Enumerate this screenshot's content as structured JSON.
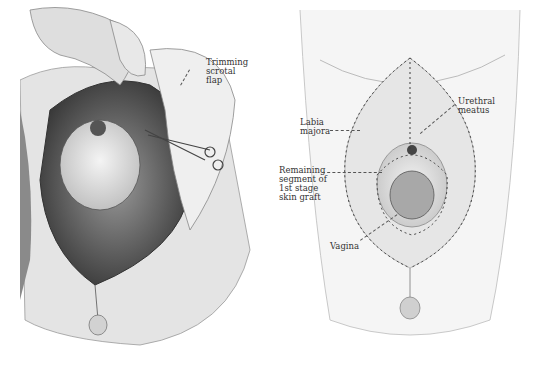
{
  "figure": {
    "left_panel": {
      "labels": [
        {
          "id": "trimming-scrotal-flap",
          "text": "Trimming\nscrotal\nflap"
        }
      ]
    },
    "right_panel": {
      "labels": [
        {
          "id": "labia-majora",
          "text": "Labia\nmajora"
        },
        {
          "id": "urethral-meatus",
          "text": "Urethral\nmeatus"
        },
        {
          "id": "remaining-segment",
          "text": "Remaining\nsegment of\n1st stage\nskin graft"
        },
        {
          "id": "vagina",
          "text": "Vagina"
        }
      ]
    },
    "colors": {
      "background": "#ffffff",
      "skin_light": "#ececec",
      "skin_mid": "#c8c8c8",
      "skin_dark": "#6a6a6a",
      "suture": "#3a3a3a",
      "label_text": "#333333"
    }
  }
}
